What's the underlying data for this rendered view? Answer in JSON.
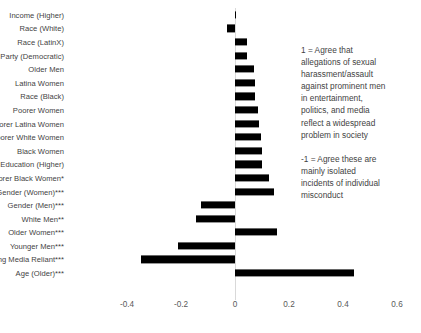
{
  "chart_data": {
    "type": "bar",
    "orientation": "horizontal",
    "title": "",
    "subtitle": "",
    "xlabel": "",
    "ylabel": "",
    "xlim": [
      -0.5,
      0.62
    ],
    "grid": false,
    "legend": null,
    "zero_reference_line": true,
    "xticks": [
      {
        "label": "-0.4",
        "value": -0.4
      },
      {
        "label": "-0.2",
        "value": -0.2
      },
      {
        "label": "0",
        "value": 0
      },
      {
        "label": "0.2",
        "value": 0.2
      },
      {
        "label": "0.4",
        "value": 0.4
      },
      {
        "label": "0.6",
        "value": 0.6
      }
    ],
    "bar_color": "#000000",
    "categories": [
      "Income (Higher)",
      "Race (White)",
      "Race (LatinX)",
      "Party (Democratic)",
      "Older Men",
      "Latina Women",
      "Race (Black)",
      "Poorer Women",
      "Poorer Latina Women",
      "Poorer White Women",
      "Black Women",
      "Education (Higher)",
      "Poorer Black Women*",
      "Gender (Women)***",
      "Gender (Men)***",
      "White Men**",
      "Older Women***",
      "Younger Men***",
      "Right-Wing Media Reliant***",
      "Age (Older)***"
    ],
    "values": [
      0.005,
      -0.03,
      0.045,
      0.045,
      0.07,
      0.075,
      0.075,
      0.085,
      0.09,
      0.095,
      0.1,
      0.1,
      0.125,
      0.145,
      -0.125,
      -0.145,
      0.155,
      -0.21,
      -0.35,
      0.44
    ]
  },
  "annotation": {
    "positive_pole": [
      "1 = Agree that",
      "allegations of sexual",
      "harassment/assault",
      "against prominent men",
      "in entertainment,",
      "politics, and media",
      "reflect a widespread",
      "problem in society"
    ],
    "negative_pole": [
      "-1 = Agree these are",
      "mainly isolated",
      "incidents of individual",
      "misconduct"
    ]
  }
}
